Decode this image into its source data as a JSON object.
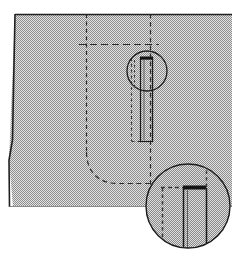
{
  "figure": {
    "kind": "technical-sewing-pattern",
    "background_color": "#ffffff",
    "fill_color": "#b3b3b3",
    "fill_texture": "halftone-dot-screen",
    "line_color": "#1a1a1a",
    "dash_color": "#2b2b2b"
  },
  "garment_panel": {
    "name": "garment-panel",
    "description": "Large gray halftone-filled fabric panel with slightly slanted left edge",
    "outline_points": "15,14 232,14 232,207 13,207 9,160",
    "top_edge_y": 14,
    "bottom_edge_y": 207,
    "right_edge_x": 232
  },
  "construction_lines": {
    "vertical_dashed_left": {
      "name": "pocket-left-placement-line",
      "x": 86,
      "y_start": 14,
      "y_end": 150
    },
    "vertical_dashed_right": {
      "name": "pocket-right-placement-line",
      "x": 150,
      "y_start": 14,
      "y_end": 185
    },
    "horizontal_dashed": {
      "name": "pocket-top-placement-line",
      "y": 44,
      "x_start": 79,
      "x_end": 159
    },
    "hem_curve": {
      "name": "curved-hem-seamline",
      "description": "Dashed curve from left placement line sweeping to horizontal hem line",
      "path": "M86,150 L86,157 C86,175 100,183 118,183 L152,183"
    }
  },
  "welt_pocket": {
    "name": "welt-pocket-detail",
    "welt_bar": {
      "name": "welt-top-bar",
      "x": 140,
      "y": 57,
      "width": 13,
      "height": 3
    },
    "pocket_opening_left_x": 140,
    "pocket_opening_right_x": 153,
    "pocket_bottom_y": 141,
    "pocket_facing_dashed_x": 131,
    "pocket_facing_bottom_y": 141
  },
  "detail_circles": [
    {
      "name": "detail-circle-upper",
      "cx": 147,
      "cy": 71,
      "r": 20,
      "filled": false,
      "label": "Detail A — welt bar end"
    },
    {
      "name": "detail-circle-magnified",
      "cx": 188,
      "cy": 206,
      "r": 42,
      "filled": true,
      "label": "Detail B — magnified welt corner"
    }
  ],
  "magnified_detail": {
    "name": "magnified-welt-corner",
    "facing_corner_vertical_x": 162,
    "facing_corner_horizontal_y": 188,
    "facing_corner_horizontal_x_end": 184,
    "facing_corner_vertical_y_end": 248,
    "welt_bar": {
      "x": 183,
      "y": 186,
      "width": 23,
      "height": 4
    },
    "welt_left_edge_x": 184,
    "welt_inner_edge_x": 187,
    "welt_right_edge_x": 206,
    "welt_bottom_y": 248,
    "top_dashed_x": 206,
    "top_dashed_y_start": 168,
    "top_dashed_y_end": 186
  }
}
